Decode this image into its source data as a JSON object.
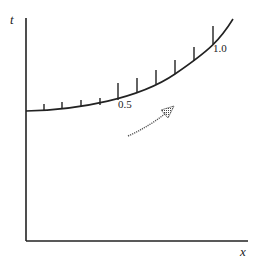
{
  "diagram": {
    "type": "characteristic-curve-plot",
    "axes": {
      "vertical_label": "t",
      "horizontal_label": "x"
    },
    "curve": {
      "description": "initial curve with tick marks indicating parameter values",
      "tick_labels": [
        {
          "value": "0.5",
          "position": "middle tick (5th)"
        },
        {
          "value": "1.0",
          "position": "10th tick near upper right"
        }
      ],
      "tick_count": 10
    },
    "arrow": {
      "style": "dotted/shaded",
      "direction": "up-right"
    },
    "colors": {
      "line": "#222222",
      "arrow": "#555555",
      "background": "#ffffff"
    }
  }
}
